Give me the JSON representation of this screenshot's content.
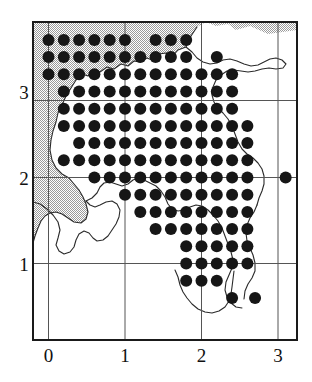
{
  "figure": {
    "name": "distribution-dot-map",
    "type": "dot-distribution-map",
    "background_color": "#ffffff",
    "frame_color": "#1a1a1a",
    "gridline_color": "#555555",
    "sea_fill_color": "#c9c9c9",
    "land_fill_color": "#ffffff",
    "coastline_color": "#2a2a2a",
    "dot_color": "#161616"
  },
  "axes": {
    "x": {
      "ticks": [
        "0",
        "1",
        "2",
        "3"
      ],
      "values": [
        0,
        1,
        2,
        3
      ],
      "label": "",
      "range": [
        -0.2,
        3.27
      ]
    },
    "y": {
      "ticks": [
        "1",
        "2",
        "3"
      ],
      "values": [
        1,
        2,
        3
      ],
      "label": "",
      "range": [
        0.45,
        3.67
      ]
    }
  },
  "chart_data": {
    "type": "scatter",
    "title": "",
    "subtitle": "",
    "xlabel": "",
    "ylabel": "",
    "xlim": [
      -0.2,
      3.27
    ],
    "ylim": [
      0.45,
      3.67
    ],
    "xticks": [
      0,
      1,
      2,
      3
    ],
    "yticks": [
      1,
      2,
      3
    ],
    "xticklabels": [
      "0",
      "1",
      "2",
      "3"
    ],
    "yticklabels": [
      "1",
      "2",
      "3"
    ],
    "grid": true,
    "legend": null,
    "marker": "filled-circle",
    "marker_size_px": 12,
    "grid_spacing": 0.2,
    "points": [
      [
        0.0,
        3.6
      ],
      [
        0.2,
        3.6
      ],
      [
        0.4,
        3.6
      ],
      [
        0.6,
        3.6
      ],
      [
        0.8,
        3.6
      ],
      [
        1.0,
        3.6
      ],
      [
        1.4,
        3.6
      ],
      [
        1.6,
        3.6
      ],
      [
        1.8,
        3.6
      ],
      [
        0.0,
        3.4
      ],
      [
        0.2,
        3.4
      ],
      [
        0.4,
        3.4
      ],
      [
        0.6,
        3.4
      ],
      [
        0.8,
        3.4
      ],
      [
        1.0,
        3.4
      ],
      [
        1.2,
        3.4
      ],
      [
        1.4,
        3.4
      ],
      [
        1.6,
        3.4
      ],
      [
        1.8,
        3.4
      ],
      [
        2.2,
        3.4
      ],
      [
        0.0,
        3.2
      ],
      [
        0.2,
        3.2
      ],
      [
        0.4,
        3.2
      ],
      [
        0.6,
        3.2
      ],
      [
        0.8,
        3.2
      ],
      [
        1.0,
        3.2
      ],
      [
        1.2,
        3.2
      ],
      [
        1.4,
        3.2
      ],
      [
        1.6,
        3.2
      ],
      [
        1.8,
        3.2
      ],
      [
        2.0,
        3.2
      ],
      [
        2.2,
        3.2
      ],
      [
        2.4,
        3.2
      ],
      [
        0.2,
        3.0
      ],
      [
        0.4,
        3.0
      ],
      [
        0.6,
        3.0
      ],
      [
        0.8,
        3.0
      ],
      [
        1.0,
        3.0
      ],
      [
        1.2,
        3.0
      ],
      [
        1.4,
        3.0
      ],
      [
        1.6,
        3.0
      ],
      [
        1.8,
        3.0
      ],
      [
        2.0,
        3.0
      ],
      [
        2.2,
        3.0
      ],
      [
        2.4,
        3.0
      ],
      [
        0.2,
        2.8
      ],
      [
        0.4,
        2.8
      ],
      [
        0.6,
        2.8
      ],
      [
        0.8,
        2.8
      ],
      [
        1.0,
        2.8
      ],
      [
        1.2,
        2.8
      ],
      [
        1.4,
        2.8
      ],
      [
        1.6,
        2.8
      ],
      [
        1.8,
        2.8
      ],
      [
        2.0,
        2.8
      ],
      [
        2.2,
        2.8
      ],
      [
        2.4,
        2.8
      ],
      [
        0.2,
        2.6
      ],
      [
        0.4,
        2.6
      ],
      [
        0.6,
        2.6
      ],
      [
        0.8,
        2.6
      ],
      [
        1.0,
        2.6
      ],
      [
        1.2,
        2.6
      ],
      [
        1.4,
        2.6
      ],
      [
        1.6,
        2.6
      ],
      [
        1.8,
        2.6
      ],
      [
        2.0,
        2.6
      ],
      [
        2.2,
        2.6
      ],
      [
        2.4,
        2.6
      ],
      [
        2.6,
        2.6
      ],
      [
        0.4,
        2.4
      ],
      [
        0.6,
        2.4
      ],
      [
        0.8,
        2.4
      ],
      [
        1.0,
        2.4
      ],
      [
        1.2,
        2.4
      ],
      [
        1.4,
        2.4
      ],
      [
        1.6,
        2.4
      ],
      [
        1.8,
        2.4
      ],
      [
        2.0,
        2.4
      ],
      [
        2.2,
        2.4
      ],
      [
        2.4,
        2.4
      ],
      [
        2.6,
        2.4
      ],
      [
        0.2,
        2.2
      ],
      [
        0.4,
        2.2
      ],
      [
        0.6,
        2.2
      ],
      [
        0.8,
        2.2
      ],
      [
        1.0,
        2.2
      ],
      [
        1.2,
        2.2
      ],
      [
        1.4,
        2.2
      ],
      [
        1.6,
        2.2
      ],
      [
        1.8,
        2.2
      ],
      [
        2.0,
        2.2
      ],
      [
        2.2,
        2.2
      ],
      [
        2.4,
        2.2
      ],
      [
        2.6,
        2.2
      ],
      [
        0.6,
        2.0
      ],
      [
        0.8,
        2.0
      ],
      [
        1.0,
        2.0
      ],
      [
        1.2,
        2.0
      ],
      [
        1.4,
        2.0
      ],
      [
        1.6,
        2.0
      ],
      [
        1.8,
        2.0
      ],
      [
        2.0,
        2.0
      ],
      [
        2.2,
        2.0
      ],
      [
        2.4,
        2.0
      ],
      [
        2.6,
        2.0
      ],
      [
        3.1,
        2.0
      ],
      [
        1.0,
        1.8
      ],
      [
        1.2,
        1.8
      ],
      [
        1.4,
        1.8
      ],
      [
        1.6,
        1.8
      ],
      [
        1.8,
        1.8
      ],
      [
        2.0,
        1.8
      ],
      [
        2.2,
        1.8
      ],
      [
        2.4,
        1.8
      ],
      [
        2.6,
        1.8
      ],
      [
        1.2,
        1.6
      ],
      [
        1.4,
        1.6
      ],
      [
        1.6,
        1.6
      ],
      [
        1.8,
        1.6
      ],
      [
        2.0,
        1.6
      ],
      [
        2.2,
        1.6
      ],
      [
        2.4,
        1.6
      ],
      [
        2.6,
        1.6
      ],
      [
        1.4,
        1.4
      ],
      [
        1.6,
        1.4
      ],
      [
        1.8,
        1.4
      ],
      [
        2.0,
        1.4
      ],
      [
        2.2,
        1.4
      ],
      [
        2.4,
        1.4
      ],
      [
        2.6,
        1.4
      ],
      [
        1.8,
        1.2
      ],
      [
        2.0,
        1.2
      ],
      [
        2.2,
        1.2
      ],
      [
        2.4,
        1.2
      ],
      [
        2.6,
        1.2
      ],
      [
        1.8,
        1.0
      ],
      [
        2.0,
        1.0
      ],
      [
        2.2,
        1.0
      ],
      [
        2.4,
        1.0
      ],
      [
        2.6,
        1.0
      ],
      [
        1.8,
        0.8
      ],
      [
        2.0,
        0.8
      ],
      [
        2.2,
        0.8
      ],
      [
        2.4,
        0.6
      ],
      [
        2.7,
        0.6
      ]
    ]
  }
}
